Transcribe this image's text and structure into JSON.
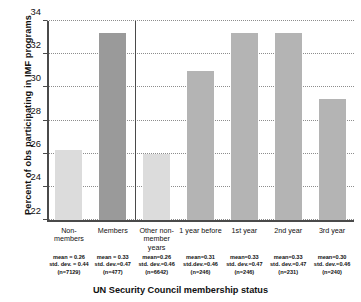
{
  "chart_data": {
    "type": "bar",
    "title": "",
    "xlabel": "UN Security Council membership status",
    "ylabel": "Percent of obs participating in IMF programs",
    "ylim": [
      22,
      34
    ],
    "yticks": [
      22,
      24,
      26,
      28,
      30,
      32,
      34
    ],
    "grid": true,
    "legend": "none",
    "categories": [
      "Non-members",
      "Members",
      "Other non-member years",
      "1 year before",
      "1st year",
      "2nd year",
      "3rd year"
    ],
    "values": [
      26.2,
      33.3,
      26.0,
      31.0,
      33.3,
      33.3,
      29.3
    ],
    "bar_colors": [
      "#dcdcdc",
      "#9a9a9a",
      "#dcdcdc",
      "#b4b4b4",
      "#b4b4b4",
      "#b4b4b4",
      "#b4b4b4"
    ],
    "divider_after_category_index": 1,
    "annotations": [
      {
        "mean": "mean = 0.26",
        "sd": "std. dev. = 0.44",
        "n": "(n=7129)"
      },
      {
        "mean": "mean = 0.33",
        "sd": "std. dev.=0.47",
        "n": "(n=477)"
      },
      {
        "mean": "mean=0.26",
        "sd": "std. dev.=0.46",
        "n": "(n=6642)"
      },
      {
        "mean": "mean=0.31",
        "sd": "std.dev.=0.46",
        "n": "(n=246)"
      },
      {
        "mean": "mean=0.33",
        "sd": "std. dev.=0.47",
        "n": "(n=246)"
      },
      {
        "mean": "mean=0.33",
        "sd": "std. dev.=0.47",
        "n": "(n=231)"
      },
      {
        "mean": "mean=0.30",
        "sd": "std. dev.=0.46",
        "n": "(n=240)"
      }
    ]
  },
  "axis": {
    "y_title": "Percent of obs participating in IMF programs",
    "x_title": "UN Security Council membership status",
    "ytick_labels": [
      "22",
      "24",
      "26",
      "28",
      "30",
      "32",
      "34"
    ]
  }
}
